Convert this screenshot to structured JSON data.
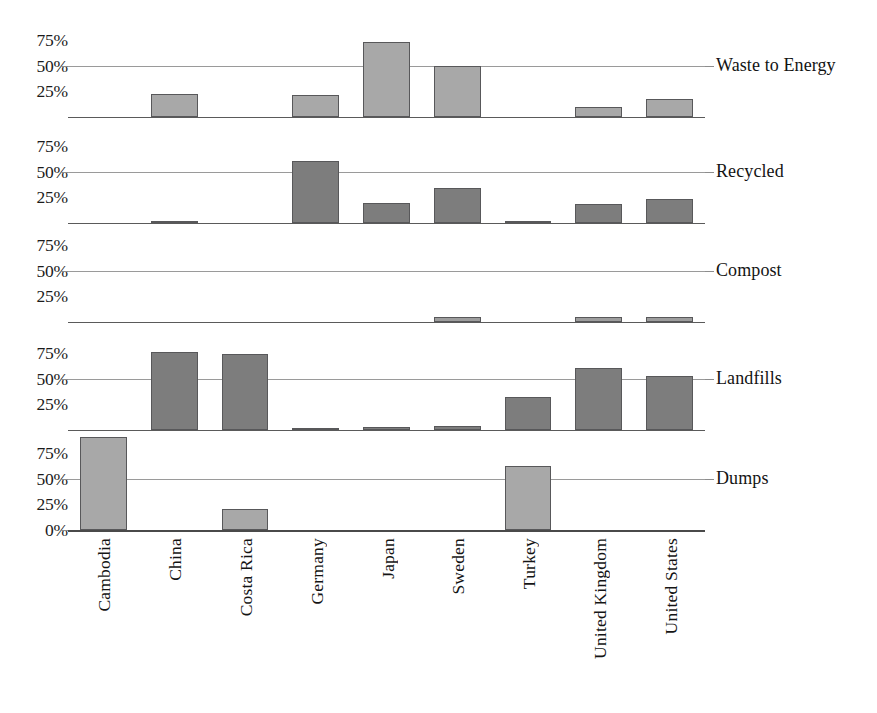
{
  "chart_data": {
    "type": "bar",
    "title": "",
    "xlabel": "",
    "ylabel": "",
    "ylim": [
      0,
      100
    ],
    "grid": true,
    "legend": "none",
    "facet_orientation": "vertical-stacked-panels",
    "categories": [
      "Cambodia",
      "China",
      "Costa Rica",
      "Germany",
      "Japan",
      "Sweden",
      "Turkey",
      "United Kingdom",
      "United States"
    ],
    "ytick_labels": [
      "75%",
      "50%",
      "25%"
    ],
    "ytick_values": [
      75,
      50,
      25
    ],
    "bottom_panel_ytick_labels": [
      "75%",
      "50%",
      "25%",
      "0%"
    ],
    "bottom_panel_ytick_values": [
      75,
      50,
      25,
      0
    ],
    "series": [
      {
        "name": "Waste to Energy",
        "color": "#a8a8a8",
        "values": [
          0,
          22,
          0,
          21,
          73,
          50,
          0,
          10,
          17
        ]
      },
      {
        "name": "Recycled",
        "color": "#7d7d7d",
        "values": [
          0,
          1,
          0,
          60,
          19,
          34,
          1,
          18,
          23
        ]
      },
      {
        "name": "Compost",
        "color": "#9d9d9d",
        "values": [
          0,
          0,
          0,
          0,
          0,
          5,
          0,
          5,
          5
        ]
      },
      {
        "name": "Landfills",
        "color": "#7d7d7d",
        "values": [
          0,
          76,
          74,
          1,
          3,
          4,
          32,
          60,
          52
        ]
      },
      {
        "name": "Dumps",
        "color": "#a8a8a8",
        "values": [
          90,
          0,
          20,
          0,
          0,
          0,
          62,
          0,
          0
        ]
      }
    ]
  },
  "colors": {
    "gridline": "#9a9a9a",
    "baseline": "#5a5a5a",
    "axis": "#4a4a4a",
    "text": "#141414",
    "bar_light": "#a8a8a8",
    "bar_dark": "#7d7d7d",
    "bar_border": "#58585a",
    "background": "#ffffff"
  }
}
